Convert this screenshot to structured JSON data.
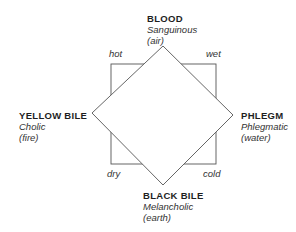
{
  "humors": {
    "top": {
      "name": "BLOOD",
      "temperament": "Sanguinous",
      "element": "(air)"
    },
    "left": {
      "name": "YELLOW BILE",
      "temperament": "Cholic",
      "element": "(fire)"
    },
    "right": {
      "name": "PHLEGM",
      "temperament": "Phlegmatic",
      "element": "(water)"
    },
    "bottom": {
      "name": "BLACK BILE",
      "temperament": "Melancholic",
      "element": "(earth)"
    }
  },
  "qualities": {
    "top_left": "hot",
    "top_right": "wet",
    "bottom_left": "dry",
    "bottom_right": "cold"
  },
  "colors": {
    "line": "#555555",
    "text": "#2a2a2a"
  }
}
